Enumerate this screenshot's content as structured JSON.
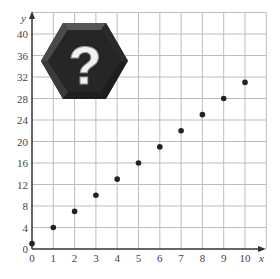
{
  "chart_data": {
    "type": "scatter",
    "title": "",
    "xlabel": "x",
    "ylabel": "y",
    "xlim": [
      0,
      11
    ],
    "ylim": [
      0,
      44
    ],
    "x_ticks": [
      0,
      1,
      2,
      3,
      4,
      5,
      6,
      7,
      8,
      9,
      10
    ],
    "y_ticks": [
      0,
      4,
      8,
      12,
      16,
      20,
      24,
      28,
      32,
      36,
      40
    ],
    "grid": true,
    "legend": null,
    "series": [
      {
        "name": "points",
        "color": "#222222",
        "x": [
          0,
          1,
          2,
          3,
          4,
          5,
          6,
          7,
          8,
          9,
          10
        ],
        "y": [
          1,
          4,
          7,
          10,
          13,
          16,
          19,
          22,
          25,
          28,
          31
        ]
      }
    ],
    "annotations": [
      {
        "type": "icon",
        "name": "question-mark-hexagon",
        "text": "?",
        "position": "upper-left"
      }
    ]
  },
  "colors": {
    "grid": "#bdbdbd",
    "axis": "#333333",
    "point": "#222222",
    "hex_dark": "#1e1e1e",
    "hex_light": "#5a5a5a"
  },
  "badge": {
    "symbol": "?"
  }
}
